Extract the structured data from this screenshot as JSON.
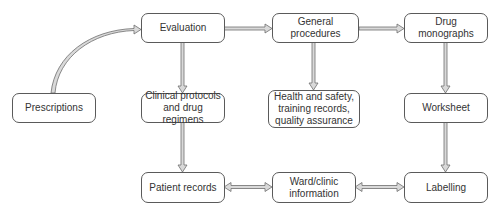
{
  "diagram": {
    "type": "flowchart",
    "nodes": {
      "evaluation": "Evaluation",
      "general_procedures": "General procedures",
      "drug_monographs": "Drug monographs",
      "prescriptions": "Prescriptions",
      "clinical_protocols": "Clinical protocols and drug regimens",
      "health_safety": "Health and safety, training records, quality assurance",
      "worksheet": "Worksheet",
      "patient_records": "Patient records",
      "ward_clinic": "Ward/clinic information",
      "labelling": "Labelling"
    },
    "edges": [
      {
        "from": "Prescriptions",
        "to": "Evaluation",
        "style": "curved"
      },
      {
        "from": "Evaluation",
        "to": "General procedures"
      },
      {
        "from": "General procedures",
        "to": "Drug monographs"
      },
      {
        "from": "Evaluation",
        "to": "Clinical protocols and drug regimens"
      },
      {
        "from": "General procedures",
        "to": "Health and safety, training records, quality assurance"
      },
      {
        "from": "Drug monographs",
        "to": "Worksheet"
      },
      {
        "from": "Clinical protocols and drug regimens",
        "to": "Patient records"
      },
      {
        "from": "Worksheet",
        "to": "Labelling"
      },
      {
        "from": "Patient records",
        "to": "Ward/clinic information",
        "bidirectional": true
      },
      {
        "from": "Ward/clinic information",
        "to": "Labelling",
        "bidirectional": true
      }
    ],
    "colors": {
      "border": "#5a5a5a",
      "arrow_fill": "#d9d9d9",
      "arrow_stroke": "#6e6e6e",
      "text": "#333333"
    }
  }
}
